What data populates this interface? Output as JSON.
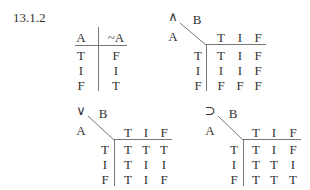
{
  "section_number": "13.1.2",
  "negation_table": {
    "headers": [
      "A",
      "~A"
    ],
    "rows": [
      [
        "T",
        "F"
      ],
      [
        "I",
        "I"
      ],
      [
        "F",
        "T"
      ]
    ]
  },
  "binary_tables": [
    {
      "name": "conjunction",
      "operator": "∧",
      "row_var": "A",
      "col_var": "B",
      "col_headers": [
        "T",
        "I",
        "F"
      ],
      "row_headers": [
        "T",
        "I",
        "F"
      ],
      "cells": [
        [
          "T",
          "I",
          "F"
        ],
        [
          "I",
          "I",
          "F"
        ],
        [
          "F",
          "F",
          "F"
        ]
      ]
    },
    {
      "name": "disjunction",
      "operator": "∨",
      "row_var": "A",
      "col_var": "B",
      "col_headers": [
        "T",
        "I",
        "F"
      ],
      "row_headers": [
        "T",
        "I",
        "F"
      ],
      "cells": [
        [
          "T",
          "T",
          "T"
        ],
        [
          "T",
          "I",
          "I"
        ],
        [
          "T",
          "I",
          "F"
        ]
      ]
    },
    {
      "name": "conditional",
      "operator": "⊃",
      "row_var": "A",
      "col_var": "B",
      "col_headers": [
        "T",
        "I",
        "F"
      ],
      "row_headers": [
        "T",
        "I",
        "F"
      ],
      "cells": [
        [
          "T",
          "I",
          "F"
        ],
        [
          "T",
          "T",
          "I"
        ],
        [
          "T",
          "T",
          "T"
        ]
      ]
    }
  ]
}
